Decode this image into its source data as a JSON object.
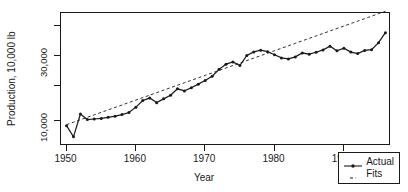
{
  "chart_data": {
    "type": "line",
    "title": "",
    "xlabel": "Year",
    "ylabel": "Production, 10,000 lb",
    "yscale": "log",
    "xlim": [
      1949.2,
      1996.8
    ],
    "ylim": [
      6600,
      62000
    ],
    "grid": false,
    "legend_position": "bottom-right",
    "xticks": [
      1950,
      1960,
      1970,
      1980,
      1990
    ],
    "xtick_labels": [
      "1950",
      "1960",
      "1970",
      "1980",
      "1990"
    ],
    "yticks": [
      10000,
      30000
    ],
    "ytick_labels": [
      "10,000",
      "30,000"
    ],
    "yticks_unlabeled": [
      18000,
      50000
    ],
    "x": [
      1950,
      1951,
      1952,
      1953,
      1954,
      1955,
      1956,
      1957,
      1958,
      1959,
      1960,
      1961,
      1962,
      1963,
      1964,
      1965,
      1966,
      1967,
      1968,
      1969,
      1970,
      1971,
      1972,
      1973,
      1974,
      1975,
      1976,
      1977,
      1978,
      1979,
      1980,
      1981,
      1982,
      1983,
      1984,
      1985,
      1986,
      1987,
      1988,
      1989,
      1990,
      1991,
      1992,
      1993,
      1994,
      1995,
      1996
    ],
    "series": [
      {
        "name": "Actual",
        "style": "solid",
        "marker": "filled-circle",
        "values": [
          9300,
          7700,
          11300,
          10300,
          10400,
          10500,
          10700,
          10900,
          11200,
          11600,
          12700,
          14200,
          14800,
          13700,
          14600,
          15500,
          17300,
          16700,
          17600,
          18700,
          19900,
          21400,
          24000,
          26200,
          27200,
          25600,
          30300,
          32200,
          33100,
          32300,
          30700,
          29100,
          28600,
          29600,
          31600,
          31000,
          32000,
          33300,
          35400,
          32800,
          34300,
          32100,
          31300,
          33000,
          33400,
          37600,
          44500
        ]
      },
      {
        "name": "Fits",
        "style": "dashed",
        "marker": "none",
        "values": [
          9450,
          9850,
          10270,
          10700,
          11160,
          11630,
          12120,
          12640,
          13170,
          13730,
          14310,
          14920,
          15550,
          16210,
          16900,
          17620,
          18360,
          19140,
          19950,
          20800,
          21680,
          22600,
          23560,
          24560,
          25600,
          26690,
          27820,
          29000,
          30230,
          31510,
          32850,
          34240,
          35690,
          37210,
          38790,
          40430,
          42150,
          43940,
          45800,
          47740,
          49770,
          51880,
          54090,
          56380,
          58770,
          61270,
          63870
        ]
      }
    ]
  },
  "legend": {
    "entries": [
      {
        "label": "Actual",
        "style": "solid-with-marker"
      },
      {
        "label": "Fits",
        "style": "dashed"
      }
    ]
  }
}
